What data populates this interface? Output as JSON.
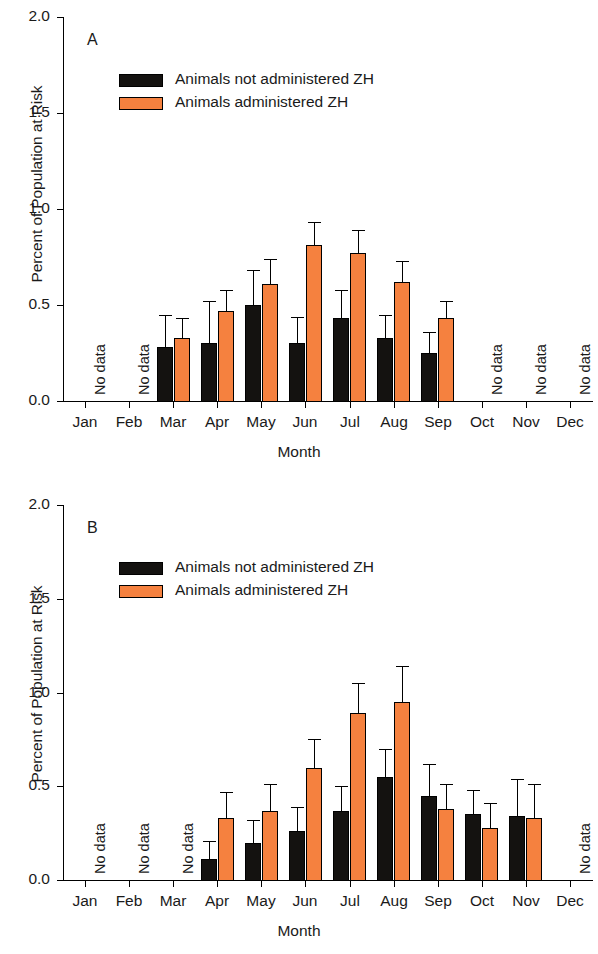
{
  "figure": {
    "background": "#ffffff",
    "colors": {
      "not_administered": "#141210",
      "administered": "#f5813f",
      "axis": "#000000",
      "text": "#1a1a1a"
    },
    "no_data_text": "No data"
  },
  "legend": {
    "items": [
      {
        "label": "Animals not administered ZH",
        "color": "#141210"
      },
      {
        "label": "Animals administered ZH",
        "color": "#f5813f"
      }
    ]
  },
  "chart_data": [
    {
      "type": "bar",
      "panel": "A",
      "title": "A",
      "xlabel": "Month",
      "ylabel": "Percent of Population at Risk",
      "ylim": [
        0.0,
        2.0
      ],
      "yticks": [
        0.0,
        0.5,
        1.0,
        1.5,
        2.0
      ],
      "ytick_labels": [
        "0.0",
        "0.5",
        "1.0",
        "1.5",
        "2.0"
      ],
      "grid": false,
      "legend_position": "upper-left",
      "categories": [
        "Jan",
        "Feb",
        "Mar",
        "Apr",
        "May",
        "Jun",
        "Jul",
        "Aug",
        "Sep",
        "Oct",
        "Nov",
        "Dec"
      ],
      "no_data_months": [
        "Jan",
        "Feb",
        "Oct",
        "Nov",
        "Dec"
      ],
      "series": [
        {
          "name": "Animals not administered ZH",
          "color": "#141210",
          "values": [
            null,
            null,
            0.28,
            0.3,
            0.5,
            0.3,
            0.43,
            0.33,
            0.25,
            null,
            null,
            null
          ],
          "errors": [
            null,
            null,
            0.17,
            0.22,
            0.18,
            0.14,
            0.15,
            0.12,
            0.11,
            null,
            null,
            null
          ]
        },
        {
          "name": "Animals administered ZH",
          "color": "#f5813f",
          "values": [
            null,
            null,
            0.33,
            0.47,
            0.61,
            0.81,
            0.77,
            0.62,
            0.43,
            null,
            null,
            null
          ],
          "errors": [
            null,
            null,
            0.1,
            0.11,
            0.13,
            0.12,
            0.12,
            0.11,
            0.09,
            null,
            null,
            null
          ]
        }
      ]
    },
    {
      "type": "bar",
      "panel": "B",
      "title": "B",
      "xlabel": "Month",
      "ylabel": "Percent of Population at Risk",
      "ylim": [
        0.0,
        2.0
      ],
      "yticks": [
        0.0,
        0.5,
        1.0,
        1.5,
        2.0
      ],
      "ytick_labels": [
        "0.0",
        "0.5",
        "1.0",
        "1.5",
        "2.0"
      ],
      "grid": false,
      "legend_position": "upper-left",
      "categories": [
        "Jan",
        "Feb",
        "Mar",
        "Apr",
        "May",
        "Jun",
        "Jul",
        "Aug",
        "Sep",
        "Oct",
        "Nov",
        "Dec"
      ],
      "no_data_months": [
        "Jan",
        "Feb",
        "Mar",
        "Dec"
      ],
      "series": [
        {
          "name": "Animals not administered ZH",
          "color": "#141210",
          "values": [
            null,
            null,
            null,
            0.11,
            0.2,
            0.26,
            0.37,
            0.55,
            0.45,
            0.35,
            0.34,
            null
          ],
          "errors": [
            null,
            null,
            null,
            0.1,
            0.12,
            0.13,
            0.13,
            0.15,
            0.17,
            0.13,
            0.2,
            null
          ]
        },
        {
          "name": "Animals administered ZH",
          "color": "#f5813f",
          "values": [
            null,
            null,
            null,
            0.33,
            0.37,
            0.6,
            0.89,
            0.95,
            0.38,
            0.28,
            0.33,
            null
          ],
          "errors": [
            null,
            null,
            null,
            0.14,
            0.14,
            0.15,
            0.16,
            0.19,
            0.13,
            0.13,
            0.18,
            null
          ]
        }
      ]
    }
  ]
}
